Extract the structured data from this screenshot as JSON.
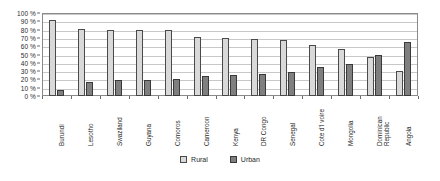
{
  "chart_data": {
    "type": "bar",
    "title": "",
    "xlabel": "",
    "ylabel": "",
    "ylim": [
      0,
      100
    ],
    "ytick_labels": [
      "100 %",
      "90 %",
      "80 %",
      "70 %",
      "60 %",
      "50 %",
      "40 %",
      "30 %",
      "20 %",
      "10 %",
      "0 %"
    ],
    "ytick_values": [
      100,
      90,
      80,
      70,
      60,
      50,
      40,
      30,
      20,
      10,
      0
    ],
    "grid": true,
    "legend_position": "bottom-center",
    "categories": [
      "Burundi",
      "Lesotho",
      "Swaziland",
      "Guyana",
      "Comoros",
      "Cameroon",
      "Kenya",
      "DR Congo",
      "Senegal",
      "Cote d'I voire",
      "Mongolia",
      "Dominican Republic",
      "Angola"
    ],
    "series": [
      {
        "name": "Rural",
        "color": "#d9d9d9",
        "values": [
          91,
          81,
          80,
          79,
          79,
          71,
          70,
          69,
          67,
          62,
          57,
          47,
          30
        ]
      },
      {
        "name": "Urban",
        "color": "#7f7f7f",
        "values": [
          7,
          17,
          19,
          19,
          20,
          24,
          25,
          26,
          29,
          35,
          38,
          50,
          65
        ]
      }
    ]
  },
  "legend": {
    "items": [
      {
        "label": "Rural"
      },
      {
        "label": "Urban"
      }
    ]
  }
}
